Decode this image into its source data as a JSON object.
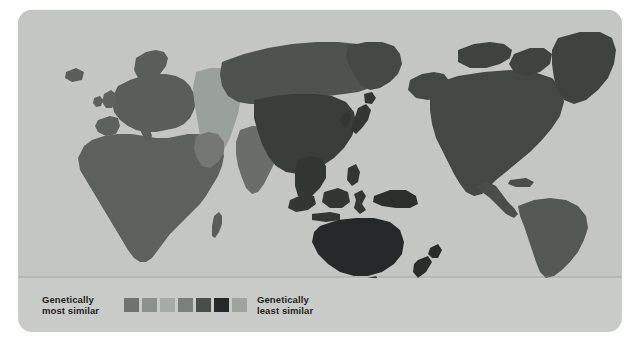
{
  "figure": {
    "card_background": "#c9cbc9",
    "page_background": "#ffffff",
    "ocean_color": "#c4c6c4"
  },
  "legend": {
    "most_similar_label": "Genetically\nmost similar",
    "least_similar_label": "Genetically\nleast similar",
    "swatches": [
      {
        "name": "swatch-1",
        "color": "#6f7370"
      },
      {
        "name": "swatch-2",
        "color": "#8d918e"
      },
      {
        "name": "swatch-3",
        "color": "#a7aba8"
      },
      {
        "name": "swatch-4",
        "color": "#7b7f7c"
      },
      {
        "name": "swatch-5",
        "color": "#494d4a"
      },
      {
        "name": "swatch-6",
        "color": "#26292a"
      },
      {
        "name": "swatch-7",
        "color": "#9fa3a0"
      }
    ]
  },
  "map": {
    "projection_note": "Pacific-centered world map",
    "regions": [
      {
        "name": "africa",
        "color": "#5e625f"
      },
      {
        "name": "europe",
        "color": "#5a5e5b"
      },
      {
        "name": "middle-east-central-asia",
        "color": "#9aa09c"
      },
      {
        "name": "south-asia",
        "color": "#6a6e6b"
      },
      {
        "name": "north-asia-siberia",
        "color": "#4f5350"
      },
      {
        "name": "east-asia",
        "color": "#3a3e3b"
      },
      {
        "name": "southeast-asia",
        "color": "#333734"
      },
      {
        "name": "australia",
        "color": "#26292a"
      },
      {
        "name": "new-guinea",
        "color": "#2c302d"
      },
      {
        "name": "new-zealand",
        "color": "#2a2e2b"
      },
      {
        "name": "north-america",
        "color": "#444845"
      },
      {
        "name": "greenland",
        "color": "#3f4340"
      },
      {
        "name": "central-america",
        "color": "#4a4e4b"
      },
      {
        "name": "south-america",
        "color": "#555956"
      }
    ]
  }
}
